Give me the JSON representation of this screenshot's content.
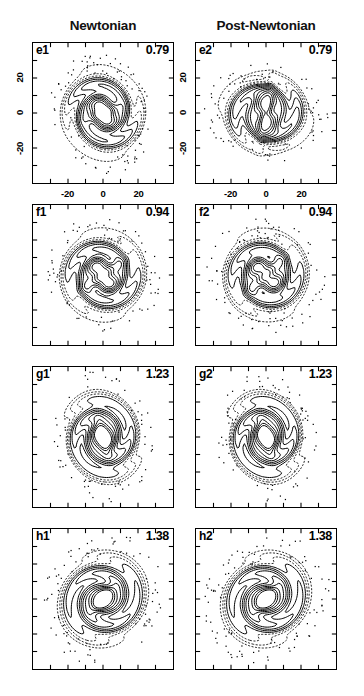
{
  "figure": {
    "columns": [
      {
        "id": "newtonian",
        "label": "Newtonian"
      },
      {
        "id": "post-newtonian",
        "label": "Post-Newtonian"
      }
    ],
    "axis": {
      "x_ticks": [
        "-20",
        "0",
        "20"
      ],
      "y_ticks": [
        "20",
        "0",
        "-20"
      ],
      "xlim": [
        -35,
        35
      ],
      "ylim": [
        -35,
        35
      ]
    },
    "rows": [
      {
        "value": "0.79",
        "left": {
          "tag": "e1"
        },
        "right": {
          "tag": "e2"
        }
      },
      {
        "value": "0.94",
        "left": {
          "tag": "f1"
        },
        "right": {
          "tag": "f2"
        }
      },
      {
        "value": "1.23",
        "left": {
          "tag": "g1"
        },
        "right": {
          "tag": "g2"
        }
      },
      {
        "value": "1.38",
        "left": {
          "tag": "h1"
        },
        "right": {
          "tag": "h2"
        }
      }
    ]
  },
  "chart_data": {
    "type": "contour",
    "title": "",
    "xlabel": "",
    "ylabel": "",
    "xlim": [
      -35,
      35
    ],
    "ylim": [
      -35,
      35
    ],
    "grid": false,
    "legend": null,
    "contour_levels": 12,
    "panels": [
      {
        "tag": "e1",
        "column": "Newtonian",
        "time": 0.79,
        "morphology": "compact oval envelope with inner double-lobe core, weak two-armed spiral winding counter-clockwise",
        "position_angle_deg": 20,
        "core_separation": 4,
        "envelope_radius_x": 17,
        "envelope_radius_y": 22,
        "peaks": [
          {
            "x": -2,
            "y": 3
          },
          {
            "x": 2,
            "y": -3
          }
        ]
      },
      {
        "tag": "e2",
        "column": "Post-Newtonian",
        "time": 0.79,
        "morphology": "bipolar dumbbell with elongated vertical inner ridge and two outer lobes",
        "position_angle_deg": 80,
        "core_separation": 7,
        "envelope_radius_x": 16,
        "envelope_radius_y": 22,
        "peaks": [
          {
            "x": -1,
            "y": 6
          },
          {
            "x": 1,
            "y": -6
          }
        ]
      },
      {
        "tag": "f1",
        "column": "Newtonian",
        "time": 0.94,
        "morphology": "elongated bar with trailing two-armed spiral, inner twin density maxima",
        "position_angle_deg": 35,
        "core_separation": 6,
        "envelope_radius_x": 19,
        "envelope_radius_y": 21,
        "peaks": [
          {
            "x": -3,
            "y": 4
          },
          {
            "x": 3,
            "y": -4
          }
        ]
      },
      {
        "tag": "f2",
        "column": "Post-Newtonian",
        "time": 0.94,
        "morphology": "tilted bar with strong asymmetric spiral arms, compact double core",
        "position_angle_deg": 45,
        "core_separation": 6,
        "envelope_radius_x": 19,
        "envelope_radius_y": 21,
        "peaks": [
          {
            "x": -4,
            "y": 4
          },
          {
            "x": 4,
            "y": -4
          }
        ]
      },
      {
        "tag": "g1",
        "column": "Newtonian",
        "time": 1.23,
        "morphology": "broad horizontally elongated envelope with S-shaped inner bar and two opposing spiral arms",
        "position_angle_deg": 105,
        "core_separation": 5,
        "envelope_radius_x": 23,
        "envelope_radius_y": 16,
        "peaks": [
          {
            "x": -1,
            "y": 2
          },
          {
            "x": 1,
            "y": -2
          }
        ]
      },
      {
        "tag": "g2",
        "column": "Post-Newtonian",
        "time": 1.23,
        "morphology": "broad horizontally elongated envelope with S-shaped inner bar, slightly more compact core than Newtonian",
        "position_angle_deg": 105,
        "core_separation": 5,
        "envelope_radius_x": 23,
        "envelope_radius_y": 16,
        "peaks": [
          {
            "x": -1,
            "y": 2
          },
          {
            "x": 1,
            "y": -2
          }
        ]
      },
      {
        "tag": "h1",
        "column": "Newtonian",
        "time": 1.38,
        "morphology": "strongly elongated bar inclined about 45 degrees with two extended spiral arms and a dense inner core",
        "position_angle_deg": 45,
        "core_separation": 4,
        "envelope_radius_x": 24,
        "envelope_radius_y": 20,
        "peaks": [
          {
            "x": -2,
            "y": -1
          },
          {
            "x": 2,
            "y": 1
          }
        ]
      },
      {
        "tag": "h2",
        "column": "Post-Newtonian",
        "time": 1.38,
        "morphology": "strongly elongated bar inclined about 45 degrees with two extended spiral arms, tighter central concentration",
        "position_angle_deg": 45,
        "core_separation": 4,
        "envelope_radius_x": 24,
        "envelope_radius_y": 20,
        "peaks": [
          {
            "x": -2,
            "y": -1
          },
          {
            "x": 2,
            "y": 1
          }
        ]
      }
    ]
  }
}
